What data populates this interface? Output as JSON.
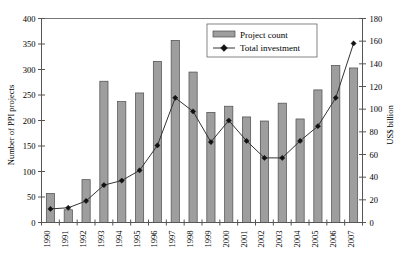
{
  "chart_data": {
    "type": "bar",
    "title": "",
    "subtitle": "",
    "xlabel": "",
    "ylabel": "Number of PPI projects",
    "y2label": "US$ billion",
    "categories": [
      "1990",
      "1991",
      "1992",
      "1993",
      "1994",
      "1995",
      "1996",
      "1997",
      "1998",
      "1999",
      "2000",
      "2001",
      "2002",
      "2003",
      "2004",
      "2005",
      "2006",
      "2007"
    ],
    "ylim": [
      0,
      400
    ],
    "y2lim": [
      0,
      180
    ],
    "yticks": [
      0,
      50,
      100,
      150,
      200,
      250,
      300,
      350,
      400
    ],
    "y2ticks": [
      0,
      20,
      40,
      60,
      80,
      100,
      120,
      140,
      160,
      180
    ],
    "grid": false,
    "legend_position": "top-right",
    "series": [
      {
        "name": "Project count",
        "type": "bar",
        "axis": "left",
        "units": "projects",
        "color": "#9e9e9e",
        "values": [
          57,
          25,
          84,
          277,
          237,
          254,
          316,
          357,
          295,
          216,
          228,
          207,
          199,
          234,
          203,
          260,
          308,
          303
        ]
      },
      {
        "name": "Total investment",
        "type": "line",
        "axis": "right",
        "units": "US$ billion",
        "color": "#111111",
        "marker": "diamond",
        "values": [
          12,
          13,
          19,
          33,
          37,
          46,
          68,
          110,
          98,
          71,
          90,
          72,
          57,
          57,
          72,
          85,
          110,
          158
        ]
      }
    ],
    "legend": [
      {
        "label": "Project count",
        "symbol": "bar-swatch"
      },
      {
        "label": "Total investment",
        "symbol": "line-diamond"
      }
    ]
  }
}
